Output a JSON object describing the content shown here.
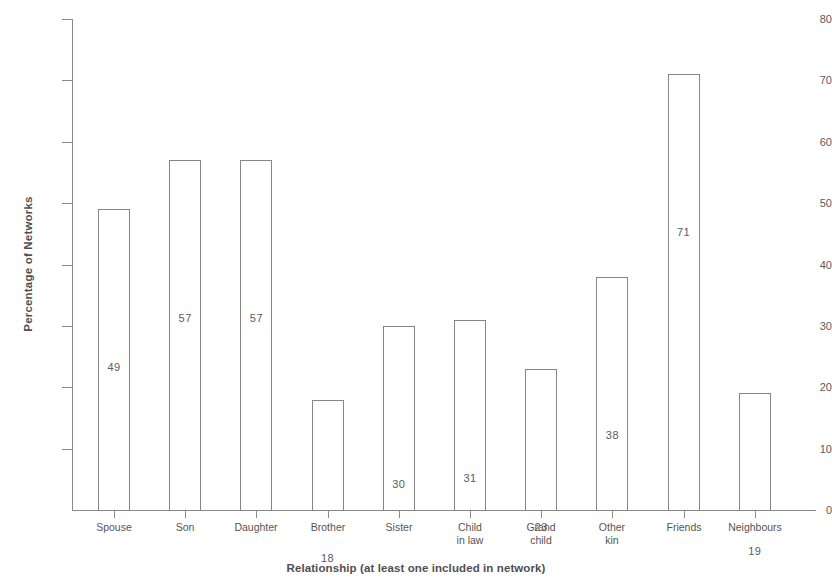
{
  "chart_data": {
    "type": "bar",
    "title": "",
    "subtitle": "",
    "xlabel": "Relationship (at least one included in network)",
    "ylabel": "Percentage of Networks",
    "categories": [
      "Spouse",
      "Son",
      "Daughter",
      "Brother",
      "Sister",
      "Child\nin law",
      "Grand\nchild",
      "Other\nkin",
      "Friends",
      "Neighbours"
    ],
    "values": [
      49,
      57,
      57,
      18,
      30,
      31,
      23,
      38,
      71,
      19
    ],
    "data_labels": [
      "49",
      "57",
      "57",
      "18",
      "30",
      "31",
      "23",
      "38",
      "71",
      "19"
    ],
    "ylim": [
      0,
      80
    ],
    "ytick_values": [
      0,
      10,
      20,
      30,
      40,
      50,
      60,
      70,
      80
    ],
    "ytick_labels": [
      "0",
      "10",
      "20",
      "30",
      "40",
      "50",
      "60",
      "70",
      "80"
    ],
    "grid": false,
    "legend": null,
    "bar_style": {
      "fill": "#ffffff",
      "stroke": "#858585"
    },
    "axis_color": "#8a8a8a",
    "text_color": "#4f4f4f"
  }
}
